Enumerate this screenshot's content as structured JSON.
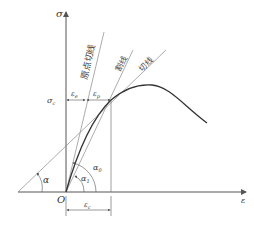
{
  "diagram": {
    "title": "",
    "axes": {
      "y_label": "σ",
      "x_label": "ε",
      "origin_label": "O"
    },
    "lines": {
      "initial_tangent": "原点切线",
      "secant": "割线",
      "tangent": "切线"
    },
    "annotations": {
      "sigma_c": "σ",
      "sigma_c_sub": "c",
      "eps_e": "ε",
      "eps_e_sub": "e",
      "eps_p": "ε",
      "eps_p_sub": "p",
      "eps_c": "ε",
      "eps_c_sub": "c",
      "alpha": "α",
      "alpha_1": "α",
      "alpha_1_sub": "1",
      "alpha_0": "α",
      "alpha_0_sub": "0"
    },
    "colors": {
      "axis": "#555555",
      "curve": "#333333",
      "thin_line": "#777777"
    }
  }
}
